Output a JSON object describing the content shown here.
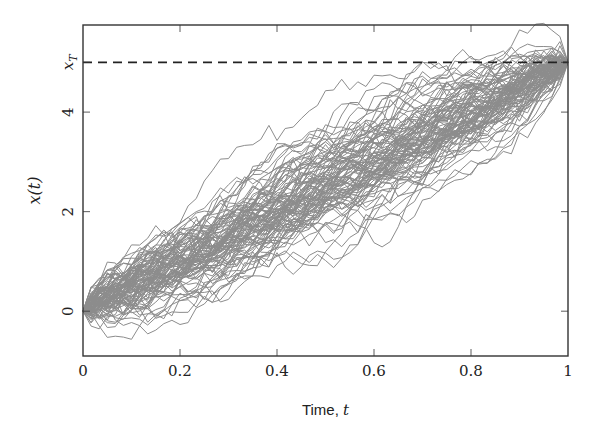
{
  "chart_data": {
    "type": "line",
    "title": "",
    "xlabel": "Time, t",
    "xlabel_text": "Time, ",
    "xlabel_var": "t",
    "ylabel": "x(t)",
    "xlim": [
      0,
      1
    ],
    "ylim": [
      -0.9,
      5.75
    ],
    "x_ticks": [
      0,
      0.2,
      0.4,
      0.6,
      0.8,
      1
    ],
    "x_tick_labels": [
      "0",
      "0.2",
      "0.4",
      "0.6",
      "0.8",
      "1"
    ],
    "y_ticks": [
      0,
      2,
      4,
      5
    ],
    "y_tick_labels": [
      "0",
      "2",
      "4",
      "x_T"
    ],
    "grid": false,
    "legend": null,
    "reference_line": {
      "y": 5,
      "label": "x_T",
      "style": "dashed",
      "color": "#222222"
    },
    "series_description": "Approximately 100 stochastic sample paths (Brownian-bridge-like) starting at x(0)=0 and converging to x_T=5 at t=1; spread is widest near t=0.5 (roughly ±1.1 around the mean trend 5t).",
    "num_paths": 100,
    "num_steps": 60,
    "start_value": 0,
    "end_value": 5,
    "volatility": 1.15,
    "envelope_samples": {
      "t": [
        0,
        0.1,
        0.2,
        0.3,
        0.4,
        0.5,
        0.6,
        0.7,
        0.8,
        0.9,
        1.0
      ],
      "mean": [
        0,
        0.5,
        1.0,
        1.5,
        2.0,
        2.5,
        3.0,
        3.5,
        4.0,
        4.5,
        5.0
      ],
      "upper": [
        0.1,
        1.1,
        1.9,
        2.5,
        3.0,
        3.8,
        4.3,
        4.9,
        5.3,
        5.4,
        5.1
      ],
      "lower": [
        -0.1,
        -0.3,
        -0.45,
        0.3,
        0.9,
        1.3,
        1.9,
        2.4,
        3.2,
        3.9,
        4.9
      ]
    },
    "line_color": "#8c8c8c"
  },
  "colors": {
    "frame": "#333333",
    "path": "#8c8c8c",
    "dash": "#222222",
    "text": "#222222"
  }
}
